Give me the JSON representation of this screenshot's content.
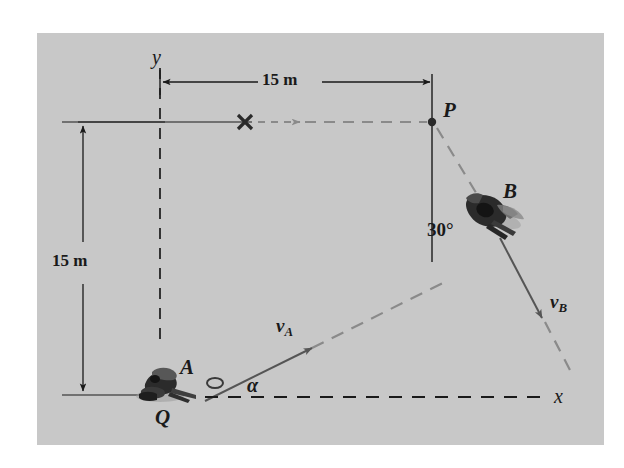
{
  "figure": {
    "panel": {
      "background_color": "#c8c8c8",
      "outer_background_color": "#ffffff"
    },
    "colors": {
      "ink": "#1a1a1a",
      "gray_ink": "#7a7a7a",
      "panel": "#c8c8c8"
    },
    "axes": {
      "y_label": "y",
      "x_label": "x"
    },
    "dimensions": [
      {
        "name": "horizontal-distance",
        "value": "15 m"
      },
      {
        "name": "vertical-distance",
        "value": "15 m"
      }
    ],
    "points": [
      {
        "name": "point-p",
        "label": "P"
      },
      {
        "name": "point-q",
        "label": "Q"
      }
    ],
    "skiers": [
      {
        "name": "skier-a",
        "label": "A",
        "velocity_label": "v",
        "velocity_sub": "A"
      },
      {
        "name": "skier-b",
        "label": "B",
        "velocity_label": "v",
        "velocity_sub": "B"
      }
    ],
    "angles": [
      {
        "name": "angle-beta",
        "label": "30°"
      },
      {
        "name": "angle-alpha",
        "label": "α"
      }
    ],
    "markers": [
      {
        "name": "cross-marker",
        "glyph": "×"
      }
    ]
  }
}
